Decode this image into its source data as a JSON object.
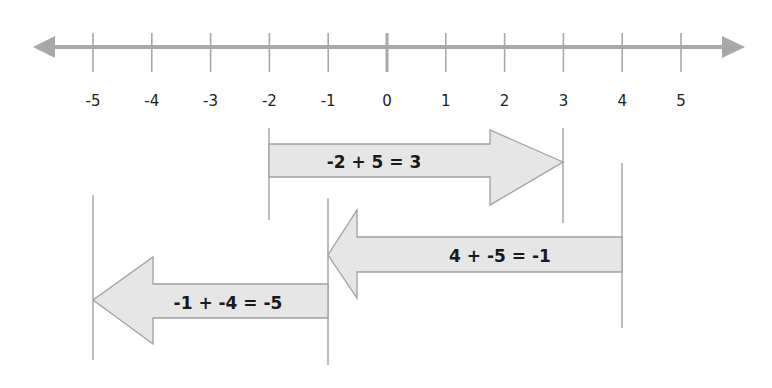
{
  "number_line": {
    "min": -5,
    "max": 5,
    "tick_labels": [
      "-5",
      "-4",
      "-3",
      "-2",
      "-1",
      "0",
      "1",
      "2",
      "3",
      "4",
      "5"
    ],
    "line_color": "#a8a8a8"
  },
  "arrows": [
    {
      "equation": "-2 + 5 = 3",
      "start": -2,
      "end": 3,
      "direction": "right"
    },
    {
      "equation": "4 + -5 =  -1",
      "start": 4,
      "end": -1,
      "direction": "left"
    },
    {
      "equation": "-1 + -4 = -5",
      "start": -1,
      "end": -5,
      "direction": "left"
    }
  ],
  "colors": {
    "arrow_fill": "#e6e6e6",
    "arrow_stroke": "#a0a0a0",
    "guide_line": "#999999"
  }
}
